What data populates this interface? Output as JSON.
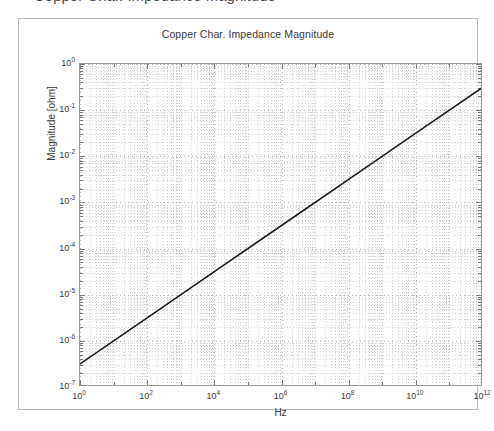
{
  "page": {
    "clipped_header_text": "Copper Char. Impedance Magnitude"
  },
  "figure": {
    "title": "Copper Char. Impedance Magnitude",
    "x_axis_title": "Hz",
    "y_axis_title": "Magnitude [ohm]",
    "line_color": "#1a1a1a",
    "grid_color": "#cfcfcf",
    "axis_color": "#9a9a9a",
    "frame_color": "#b9b9b9",
    "text_color": "#3a3a3a"
  },
  "chart_data": {
    "type": "line",
    "title": "Copper Char. Impedance Magnitude",
    "xlabel": "Hz",
    "ylabel": "Magnitude [ohm]",
    "xscale": "log",
    "yscale": "log",
    "xlim": [
      1,
      1000000000000
    ],
    "ylim": [
      1e-07,
      1
    ],
    "grid": true,
    "grid_which": "both",
    "legend": "none",
    "x_tick_labels": [
      "10^0",
      "10^2",
      "10^4",
      "10^6",
      "10^8",
      "10^10",
      "10^12"
    ],
    "x_tick_exponents": [
      0,
      2,
      4,
      6,
      8,
      10,
      12
    ],
    "y_tick_labels": [
      "10^0",
      "10^-1",
      "10^-2",
      "10^-3",
      "10^-4",
      "10^-5",
      "10^-6",
      "10^-7"
    ],
    "y_tick_exponents": [
      0,
      -1,
      -2,
      -3,
      -4,
      -5,
      -6,
      -7
    ],
    "series": [
      {
        "name": "Copper characteristic impedance magnitude",
        "color": "#1a1a1a",
        "linewidth": 1.6,
        "slope_decades_per_decade": 0.5,
        "x": [
          1,
          100,
          10000,
          1000000,
          100000000,
          10000000000,
          1000000000000
        ],
        "y": [
          3.16e-07,
          3.16e-06,
          3.16e-05,
          0.000316,
          0.00316,
          0.0316,
          0.316
        ],
        "log10_x": [
          0,
          2,
          4,
          6,
          8,
          10,
          12
        ],
        "log10_y": [
          -6.5,
          -5.5,
          -4.5,
          -3.5,
          -2.5,
          -1.5,
          -0.5
        ]
      }
    ]
  }
}
